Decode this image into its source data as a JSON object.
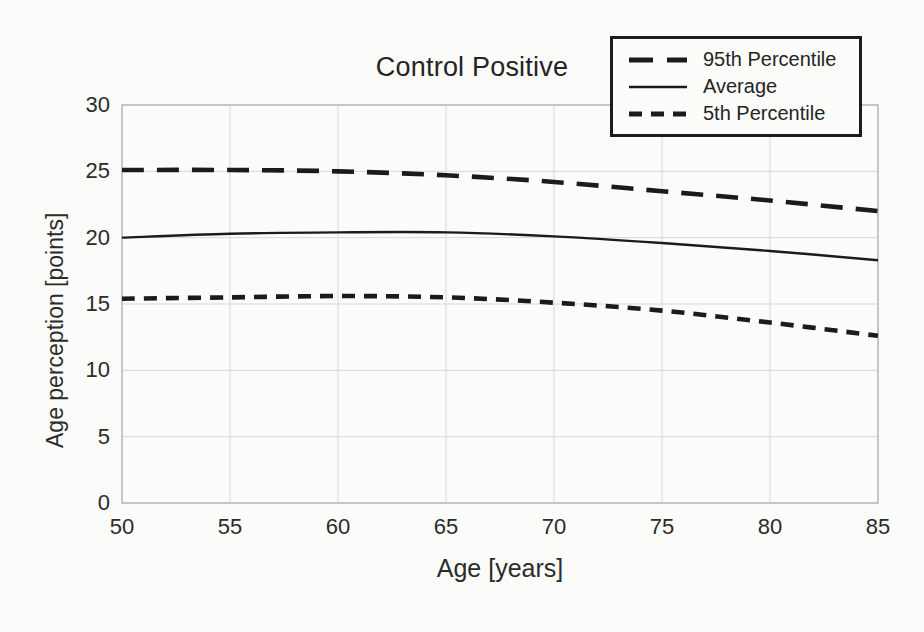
{
  "title": "Control Positive",
  "axes": {
    "x_label": "Age [years]",
    "y_label": "Age perception [points]",
    "x_ticks": [
      "50",
      "55",
      "60",
      "65",
      "70",
      "75",
      "80",
      "85"
    ],
    "y_ticks": [
      "0",
      "5",
      "10",
      "15",
      "20",
      "25",
      "30"
    ]
  },
  "legend": {
    "items": [
      {
        "label": "95th Percentile",
        "style": "long-dash"
      },
      {
        "label": "Average",
        "style": "solid"
      },
      {
        "label": "5th Percentile",
        "style": "short-dash"
      }
    ]
  },
  "colors": {
    "line": "#1b1b1b",
    "grid": "#d7d7d5",
    "frame": "#bdbdbb",
    "text": "#2b2b2b",
    "background": "#fbfbf9"
  },
  "chart_data": {
    "type": "line",
    "title": "Control Positive",
    "xlabel": "Age [years]",
    "ylabel": "Age perception [points]",
    "x": [
      50,
      55,
      60,
      65,
      70,
      75,
      80,
      85
    ],
    "xlim": [
      50,
      85
    ],
    "ylim": [
      0,
      30
    ],
    "grid": true,
    "legend_position": "top-right",
    "series": [
      {
        "name": "95th Percentile",
        "dash": "long",
        "values": [
          25.1,
          25.1,
          25.0,
          24.7,
          24.2,
          23.5,
          22.8,
          22.0
        ]
      },
      {
        "name": "Average",
        "dash": "solid",
        "values": [
          20.0,
          20.3,
          20.4,
          20.4,
          20.1,
          19.6,
          19.0,
          18.3
        ]
      },
      {
        "name": "5th Percentile",
        "dash": "short",
        "values": [
          15.4,
          15.5,
          15.6,
          15.5,
          15.1,
          14.5,
          13.6,
          12.6
        ]
      }
    ]
  }
}
